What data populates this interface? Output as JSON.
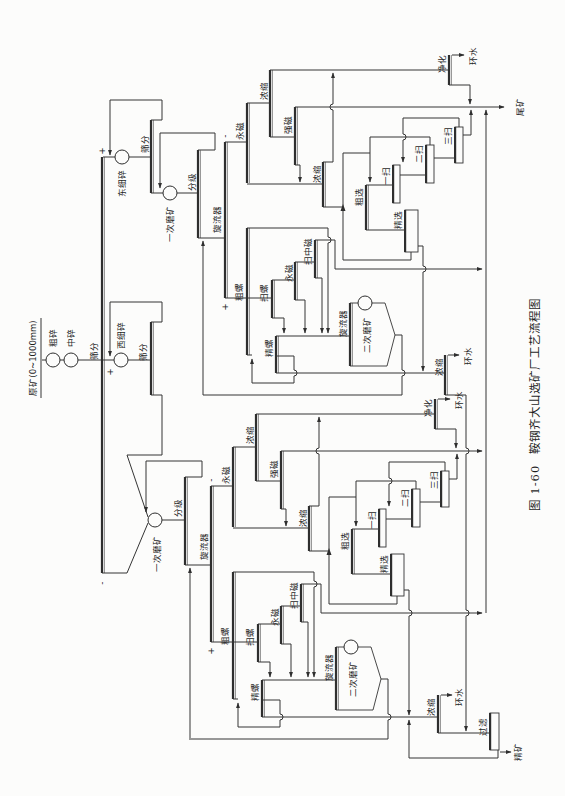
{
  "figure": {
    "caption_number": "图 1-60",
    "caption_title": "鞍钢齐大山选矿厂工艺流程图"
  },
  "crushing": {
    "raw_ore": "原矿(0~1000mm)",
    "coarse_crushing": "粗碎",
    "medium_crushing": "中碎",
    "main_screening": "筛分",
    "plus_mark_east": "+",
    "plus_mark_west": "+",
    "minus_mark": "-"
  },
  "east_series": {
    "fine_crushing": "东细碎",
    "screening": "筛分",
    "primary_grinding": "一次磨矿",
    "classification": "分级",
    "cyclone": "旋流器"
  },
  "west_series": {
    "fine_crushing": "西细碎",
    "screening": "筛分",
    "primary_grinding": "一次磨矿",
    "classification": "分级",
    "cyclone": "旋流器"
  },
  "east_circuit": {
    "overflow_mark": "-",
    "underflow_mark": "+",
    "permanent_magnetic": "永磁",
    "thickening_1": "浓缩",
    "high_intensity_magnetic": "强磁",
    "thickening_2": "浓缩",
    "flotation_rougher": "粗选",
    "scavenger_1": "一扫",
    "scavenger_2": "二扫",
    "scavenger_3": "三扫",
    "flotation_cleaner": "精选",
    "purification": "净化",
    "return_water": "环水",
    "rougher_spiral": "粗螺",
    "scavenger_spiral": "扫螺",
    "permanent_magnetic_2": "永磁",
    "scavenger_medium_magnetic": "扫中磁",
    "cleaner_spiral": "精螺",
    "cyclone_2": "旋流器",
    "secondary_grinding": "二次磨矿"
  },
  "west_circuit": {
    "overflow_mark": "-",
    "underflow_mark": "+",
    "permanent_magnetic": "永磁",
    "thickening_1": "浓缩",
    "high_intensity_magnetic": "强磁",
    "thickening_2": "浓缩",
    "flotation_rougher": "粗选",
    "scavenger_1": "一扫",
    "scavenger_2": "二扫",
    "scavenger_3": "三扫",
    "flotation_cleaner": "精选",
    "purification": "净化",
    "return_water": "环水",
    "rougher_spiral": "粗螺",
    "scavenger_spiral": "扫螺",
    "permanent_magnetic_2": "永磁",
    "scavenger_medium_magnetic": "扫中磁",
    "cleaner_spiral": "精螺",
    "cyclone_2": "旋流器",
    "secondary_grinding": "二次磨矿"
  },
  "products": {
    "tailings": "尾矿",
    "concentrate": "精矿",
    "filtration": "过滤",
    "east_concentrate_thickening": "浓缩",
    "east_return_water": "环水",
    "west_concentrate_thickening": "浓缩",
    "west_return_water": "环水"
  },
  "colors": {
    "line": "#343434",
    "background": "#fcfcfb"
  }
}
